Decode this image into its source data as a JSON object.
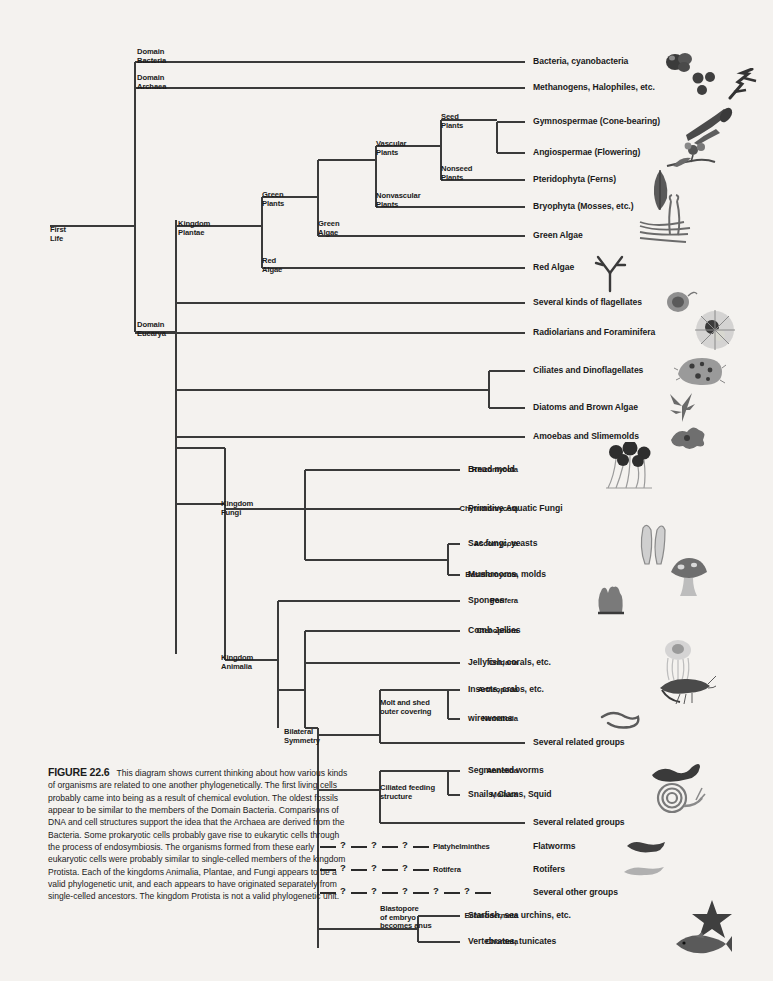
{
  "figure": {
    "number": "FIGURE 22.6",
    "caption": "This diagram shows current thinking about how various kinds of organisms are related to one another phylogenetically. The first living cells probably came into being as a result of chemical evolution. The oldest fossils appear to be similar to the members of the Domain Bacteria. Comparisons of DNA and cell structures support the idea that the Archaea are derived from the Bacteria. Some prokaryotic cells probably gave rise to eukarytic cells through the process of endosymbiosis. The organisms formed from these early eukaryotic cells were probably similar to single-celled members of the kingdom Protista. Each of the kingdoms Animalia, Plantae, and Fungi appears to be a valid phylogenetic unit, and each appears to have originated separately from single-celled ancestors. The kingdom Protista is not a valid phylogenetic unit."
  },
  "colors": {
    "line": "#3a3a3a",
    "text": "#1a1a1a",
    "background": "#f4f2ef"
  },
  "nodes": [
    {
      "name": "root",
      "line1": "First",
      "line2": "Life",
      "x": 50,
      "y": 226
    },
    {
      "name": "domain-bacteria",
      "line1": "Domain",
      "line2": "Bacteria",
      "x": 137,
      "y": 48
    },
    {
      "name": "domain-archaea",
      "line1": "Domain",
      "line2": "Archaea",
      "x": 137,
      "y": 74
    },
    {
      "name": "domain-eucarya",
      "line1": "Domain",
      "line2": "Eucarya",
      "x": 137,
      "y": 321
    },
    {
      "name": "kingdom-plantae",
      "line1": "Kingdom",
      "line2": "Plantae",
      "x": 178,
      "y": 220
    },
    {
      "name": "green-plants",
      "line1": "Green",
      "line2": "Plants",
      "x": 262,
      "y": 191
    },
    {
      "name": "red-algae-node",
      "line1": "Red",
      "line2": "Algae",
      "x": 262,
      "y": 257
    },
    {
      "name": "green-algae-node",
      "line1": "Green",
      "line2": "Algae",
      "x": 318,
      "y": 220
    },
    {
      "name": "vascular-plants",
      "line1": "Vascular",
      "line2": "Plants",
      "x": 376,
      "y": 140
    },
    {
      "name": "nonvascular-plants",
      "line1": "Nonvascular",
      "line2": "Plants",
      "x": 376,
      "y": 192
    },
    {
      "name": "seed-plants",
      "line1": "Seed",
      "line2": "Plants",
      "x": 441,
      "y": 113
    },
    {
      "name": "nonseed-plants",
      "line1": "Nonseed",
      "line2": "Plants",
      "x": 441,
      "y": 165
    },
    {
      "name": "kingdom-fungi",
      "line1": "Kingdom",
      "line2": "Fungi",
      "x": 221,
      "y": 500
    },
    {
      "name": "kingdom-animalia",
      "line1": "Kingdom",
      "line2": "Animalia",
      "x": 221,
      "y": 654
    },
    {
      "name": "bilateral-symmetry",
      "line1": "Bilateral",
      "line2": "Symmetry",
      "x": 284,
      "y": 728
    },
    {
      "name": "molt-and-shed",
      "line1": "Molt and shed",
      "line2": "outer covering",
      "x": 380,
      "y": 699
    },
    {
      "name": "ciliated-feeding",
      "line1": "Ciliated feeding",
      "line2": "structure",
      "x": 380,
      "y": 784
    },
    {
      "name": "blastopore",
      "line1": "Blastopore",
      "line2": "of embryo",
      "line3": "becomes anus",
      "x": 380,
      "y": 905
    }
  ],
  "leaves": [
    {
      "name": "bacteria",
      "taxon": "",
      "common": "Bacteria, cyanobacteria",
      "y": 62,
      "tip": 525,
      "art": "bacteria"
    },
    {
      "name": "archaea",
      "taxon": "",
      "common": "Methanogens, Halophiles, etc.",
      "y": 88,
      "tip": 525,
      "art": "archaea"
    },
    {
      "name": "gymnospermae",
      "taxon": "",
      "common": "Gymnospermae (Cone-bearing)",
      "y": 122,
      "tip": 525,
      "art": "conifer"
    },
    {
      "name": "angiospermae",
      "taxon": "",
      "common": "Angiospermae (Flowering)",
      "y": 153,
      "tip": 525,
      "art": "flower"
    },
    {
      "name": "pteridophyta",
      "taxon": "",
      "common": "Pteridophyta (Ferns)",
      "y": 180,
      "tip": 525,
      "art": "fern"
    },
    {
      "name": "bryophyta",
      "taxon": "",
      "common": "Bryophyta (Mosses, etc.)",
      "y": 207,
      "tip": 525,
      "art": "moss"
    },
    {
      "name": "green-algae",
      "taxon": "",
      "common": "Green Algae",
      "y": 236,
      "tip": 525,
      "art": "greenalga"
    },
    {
      "name": "red-algae",
      "taxon": "",
      "common": "Red Algae",
      "y": 268,
      "tip": 525,
      "art": "redalga"
    },
    {
      "name": "flagellates",
      "taxon": "",
      "common": "Several kinds of flagellates",
      "y": 303,
      "tip": 525,
      "art": "flagellate"
    },
    {
      "name": "radiolarians",
      "taxon": "",
      "common": "Radiolarians and Foraminifera",
      "y": 333,
      "tip": 525,
      "art": "radiolarian"
    },
    {
      "name": "ciliates",
      "taxon": "",
      "common": "Ciliates and Dinoflagellates",
      "y": 371,
      "tip": 525,
      "art": "ciliate"
    },
    {
      "name": "diatoms",
      "taxon": "",
      "common": "Diatoms and Brown Algae",
      "y": 408,
      "tip": 525,
      "art": "brownalga"
    },
    {
      "name": "amoebas",
      "taxon": "",
      "common": "Amoebas and Slimemolds",
      "y": 437,
      "tip": 525,
      "art": "amoeba"
    },
    {
      "name": "rhizomycota",
      "taxon": "Rhizomycota",
      "common": "Bread mold",
      "y": 470,
      "tip": 460,
      "art": "breadmold"
    },
    {
      "name": "chytridiomycota",
      "taxon": "Chytridiomycota",
      "common": "Primitive Aquatic Fungi",
      "y": 509,
      "tip": 460,
      "art": ""
    },
    {
      "name": "ascomycota",
      "taxon": "Ascomycota",
      "common": "Sac fungi, yeasts",
      "y": 544,
      "tip": 460,
      "art": "sacfungi"
    },
    {
      "name": "basidiomycota",
      "taxon": "Basidiomycota",
      "common": "Mushrooms, molds",
      "y": 575,
      "tip": 460,
      "art": "mushroom"
    },
    {
      "name": "porifera",
      "taxon": "Porifera",
      "common": "Sponges",
      "y": 601,
      "tip": 460,
      "art": "sponge"
    },
    {
      "name": "ctenophora",
      "taxon": "Ctenophora",
      "common": "Comb Jellies",
      "y": 631,
      "tip": 460,
      "art": ""
    },
    {
      "name": "cnidaria",
      "taxon": "Cnidaria",
      "common": "Jellyfish, corals, etc.",
      "y": 663,
      "tip": 460,
      "art": "jellyfish"
    },
    {
      "name": "arthropoda",
      "taxon": "Arthropoda",
      "common": "Insects, crabs, etc.",
      "y": 690,
      "tip": 460,
      "art": "shrimp"
    },
    {
      "name": "nematoda",
      "taxon": "Nematoda",
      "common": "wireworms",
      "y": 719,
      "tip": 460,
      "art": "wireworm"
    },
    {
      "name": "several-related-1",
      "taxon": "",
      "common": "Several related groups",
      "y": 743,
      "tip": 525,
      "art": ""
    },
    {
      "name": "annelida",
      "taxon": "Annelida",
      "common": "Segmented worms",
      "y": 771,
      "tip": 460,
      "art": "annelid"
    },
    {
      "name": "molluca",
      "taxon": "Molluca",
      "common": "Snails, Clams, Squid",
      "y": 795,
      "tip": 460,
      "art": "snail"
    },
    {
      "name": "several-related-2",
      "taxon": "",
      "common": "Several related groups",
      "y": 823,
      "tip": 525,
      "art": ""
    },
    {
      "name": "echinodermata",
      "taxon": "Echinodermata",
      "common": "Starfish, sea urchins, etc.",
      "y": 916,
      "tip": 460,
      "art": "starfish"
    },
    {
      "name": "chordata",
      "taxon": "Chordata",
      "common": "Vertebrates, tunicates",
      "y": 942,
      "tip": 460,
      "art": "fish"
    }
  ],
  "question_rows": [
    {
      "name": "platyhelminthes-row",
      "marks": 3,
      "taxon": "Platyhelminthes",
      "common": "Flatworms",
      "y": 847,
      "art": "flatworm"
    },
    {
      "name": "rotifera-row",
      "marks": 3,
      "taxon": "Rotifera",
      "common": "Rotifers",
      "y": 870,
      "art": "rotifer"
    },
    {
      "name": "several-other-row",
      "marks": 5,
      "taxon": "",
      "common": "Several other groups",
      "y": 893,
      "art": ""
    }
  ],
  "question_mark": "?"
}
